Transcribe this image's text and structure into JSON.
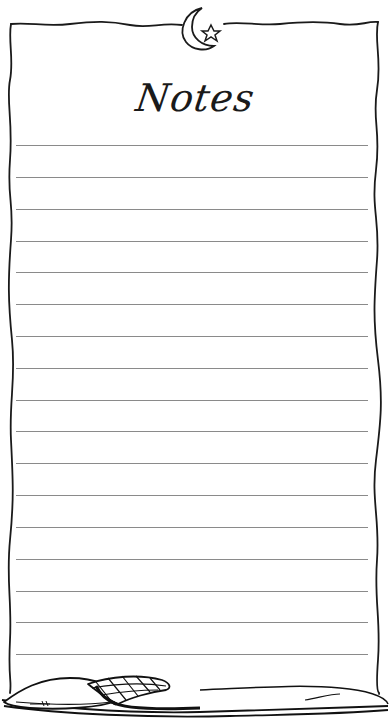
{
  "page": {
    "title": "Notes",
    "line_count": 17,
    "line_color": "#8a8a8a",
    "ink_color": "#1a1a1a",
    "background": "#ffffff"
  },
  "decorations": {
    "top": "crescent-moon-with-star",
    "bottom": "pillow-and-plaid-blanket"
  }
}
